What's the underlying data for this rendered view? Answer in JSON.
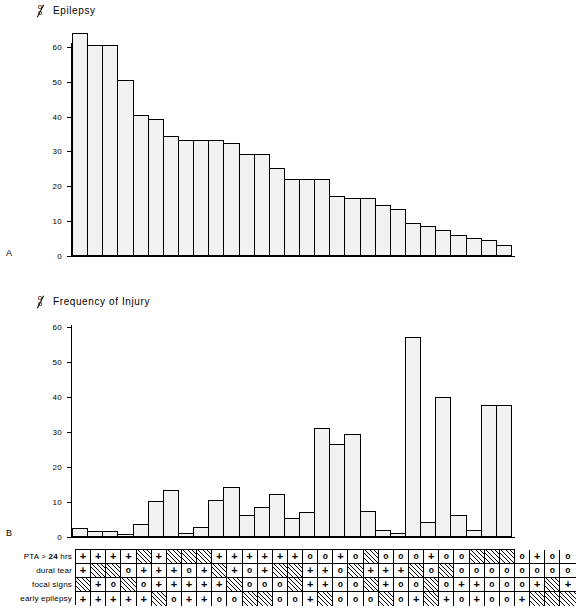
{
  "figure": {
    "panel_a": {
      "letter": "A",
      "percent_symbol_top": "o",
      "percent_symbol_bottom": "o",
      "title": "Epilepsy",
      "y_ticks": [
        "60",
        "50",
        "40",
        "30",
        "20",
        "10",
        "0"
      ]
    },
    "panel_b": {
      "letter": "B",
      "percent_symbol_top": "o",
      "percent_symbol_bottom": "o",
      "title": "Frequency of Injury",
      "y_ticks": [
        "60",
        "50",
        "40",
        "30",
        "20",
        "10",
        "0"
      ]
    }
  },
  "table": {
    "row_labels": [
      "PTA > 24 hrs",
      "dural tear",
      "focal signs",
      "early epilepsy"
    ],
    "symbols": {
      "present": "+",
      "circle": "o",
      "hatched": ""
    },
    "rows": [
      [
        "+",
        "+",
        "+",
        "+",
        "",
        "+",
        "",
        "",
        "",
        "+",
        "+",
        "+",
        "+",
        "+",
        "+",
        "o",
        "o",
        "+",
        "o",
        "",
        "o",
        "o",
        "o",
        "+",
        "o",
        "o",
        "",
        "",
        "",
        "o",
        "+",
        "o",
        "o"
      ],
      [
        "+",
        "",
        "",
        "o",
        "+",
        "+",
        "+",
        "o",
        "+",
        "",
        "+",
        "o",
        "+",
        "",
        "",
        "+",
        "+",
        "o",
        "",
        "+",
        "+",
        "+",
        "",
        "o",
        "",
        "o",
        "o",
        "o",
        "o",
        "o",
        "o",
        "o",
        "o"
      ],
      [
        "",
        "+",
        "o",
        "",
        "o",
        "+",
        "+",
        "+",
        "+",
        "+",
        "",
        "o",
        "o",
        "o",
        "",
        "+",
        "+",
        "o",
        "o",
        "",
        "+",
        "o",
        "o",
        "",
        "o",
        "+",
        "+",
        "o",
        "o",
        "o",
        "+",
        "",
        "+"
      ],
      [
        "+",
        "+",
        "+",
        "+",
        "+",
        "",
        "o",
        "+",
        "+",
        "o",
        "o",
        "",
        "",
        "o",
        "o",
        "+",
        "",
        "o",
        "o",
        "o",
        "",
        "o",
        "+",
        "",
        "+",
        "o",
        "+",
        "o",
        "o",
        "+",
        "",
        "",
        ""
      ]
    ]
  },
  "chart_data": [
    {
      "type": "bar",
      "title": "Epilepsy",
      "panel": "A",
      "ylabel": "%",
      "xlabel": "",
      "ylim": [
        0,
        64
      ],
      "y_ticks": [
        0,
        10,
        20,
        30,
        40,
        50,
        60
      ],
      "grid": false,
      "legend": "none",
      "categories": [
        "1",
        "2",
        "3",
        "4",
        "5",
        "6",
        "7",
        "8",
        "9",
        "10",
        "11",
        "12",
        "13",
        "14",
        "15",
        "16",
        "17",
        "18",
        "19",
        "20",
        "21",
        "22",
        "23",
        "24",
        "25",
        "26",
        "27",
        "28",
        "29"
      ],
      "values": [
        63.5,
        60.0,
        60.0,
        50.0,
        40.0,
        39.0,
        34.0,
        33.0,
        33.0,
        33.0,
        32.0,
        29.0,
        29.0,
        25.0,
        22.0,
        22.0,
        22.0,
        17.0,
        16.5,
        16.5,
        14.5,
        13.5,
        9.5,
        8.5,
        7.5,
        6.0,
        5.0,
        4.5,
        3.0
      ]
    },
    {
      "type": "bar",
      "title": "Frequency of Injury",
      "panel": "B",
      "ylabel": "%",
      "xlabel": "",
      "ylim": [
        0,
        60
      ],
      "y_ticks": [
        0,
        10,
        20,
        30,
        40,
        50,
        60
      ],
      "grid": false,
      "legend": "none",
      "categories": [
        "1",
        "2",
        "3",
        "4",
        "5",
        "6",
        "7",
        "8",
        "9",
        "10",
        "11",
        "12",
        "13",
        "14",
        "15",
        "16",
        "17",
        "18",
        "19",
        "20",
        "21",
        "22",
        "23",
        "24",
        "25",
        "26",
        "27",
        "28",
        "29"
      ],
      "values": [
        2.5,
        1.8,
        1.8,
        0.8,
        3.6,
        10.3,
        13.3,
        1.0,
        2.8,
        10.5,
        14.2,
        6.3,
        8.5,
        12.3,
        5.5,
        7.0,
        31.0,
        26.5,
        29.3,
        7.5,
        2.0,
        1.0,
        57.0,
        4.3,
        39.7,
        6.3,
        2.0,
        37.5,
        37.5
      ]
    }
  ]
}
